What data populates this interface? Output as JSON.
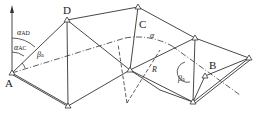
{
  "diagram": {
    "type": "triangulation-network",
    "points": {
      "A": {
        "label": "A"
      },
      "B": {
        "label": "B"
      },
      "C": {
        "label": "C"
      },
      "D": {
        "label": "D"
      }
    },
    "annotations": {
      "alpha_AD": {
        "symbol": "α",
        "sub": "AD"
      },
      "alpha_AC": {
        "symbol": "α",
        "sub": "AC"
      },
      "beta_a_left": {
        "symbol": "β",
        "sub": "a"
      },
      "beta_a_right": {
        "symbol": "β",
        "sub": "a"
      },
      "alpha": {
        "symbol": "α"
      },
      "radius": {
        "symbol": "R"
      }
    },
    "colors": {
      "line": "#333333",
      "background": "#ffffff"
    }
  }
}
